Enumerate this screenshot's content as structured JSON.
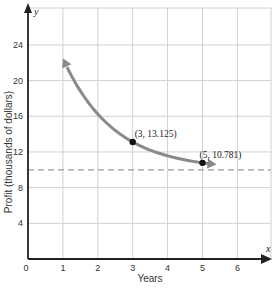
{
  "chart_data": {
    "type": "line",
    "title": "",
    "xlabel": "Years",
    "ylabel": "Profit (thousands of dollars)",
    "x_axis_name": "x",
    "y_axis_name": "y",
    "xlim": [
      0,
      7
    ],
    "ylim": [
      0,
      28
    ],
    "x_ticks": [
      0,
      1,
      2,
      3,
      4,
      5,
      6
    ],
    "y_ticks": [
      4,
      8,
      12,
      16,
      20,
      24
    ],
    "grid": true,
    "function": "y = 10 + 25(0.5)^x",
    "curve_domain": [
      1,
      5.4
    ],
    "series": [
      {
        "name": "profit",
        "x": [
          1,
          1.5,
          2,
          2.5,
          3,
          3.5,
          4,
          4.5,
          5,
          5.4
        ],
        "y": [
          22.5,
          18.84,
          16.25,
          14.42,
          13.125,
          12.21,
          11.56,
          11.1,
          10.781,
          10.59
        ]
      }
    ],
    "points": [
      {
        "x": 3,
        "y": 13.125,
        "label": "(3, 13.125)"
      },
      {
        "x": 5,
        "y": 10.781,
        "label": "(5, 10.781)"
      }
    ],
    "asymptote": {
      "y": 10,
      "style": "dashed"
    },
    "colors": {
      "curve": "#8a8a8a",
      "grid": "#d0d0d0",
      "axis": "#222222",
      "asymptote": "#9a9a9a",
      "point": "#111111"
    }
  }
}
